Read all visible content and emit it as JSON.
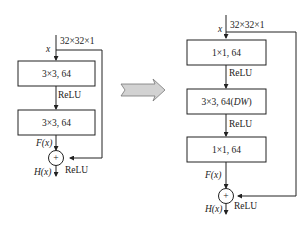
{
  "left_block": {
    "input_label": "x",
    "input_dim": "32×32×1",
    "layers": [
      "3×3, 64",
      "3×3, 64"
    ],
    "activation_between": "ReLU",
    "residual_label": "F(x)",
    "output_label": "H(x)",
    "output_activation": "ReLU",
    "add_symbol": "+"
  },
  "arrow": {
    "direction": "right",
    "color": "#c8c8c8"
  },
  "right_block": {
    "input_label": "x",
    "input_dim": "32×32×1",
    "layers": [
      "1×1, 64",
      "3×3, 64(DW)",
      "1×1, 64"
    ],
    "layer2_main": "3×3, 64(",
    "layer2_italic": "DW",
    "layer2_close": ")",
    "activation_1": "ReLU",
    "activation_2": "ReLU",
    "residual_label": "F(x)",
    "output_label": "H(x)",
    "output_activation": "ReLU",
    "add_symbol": "+"
  }
}
